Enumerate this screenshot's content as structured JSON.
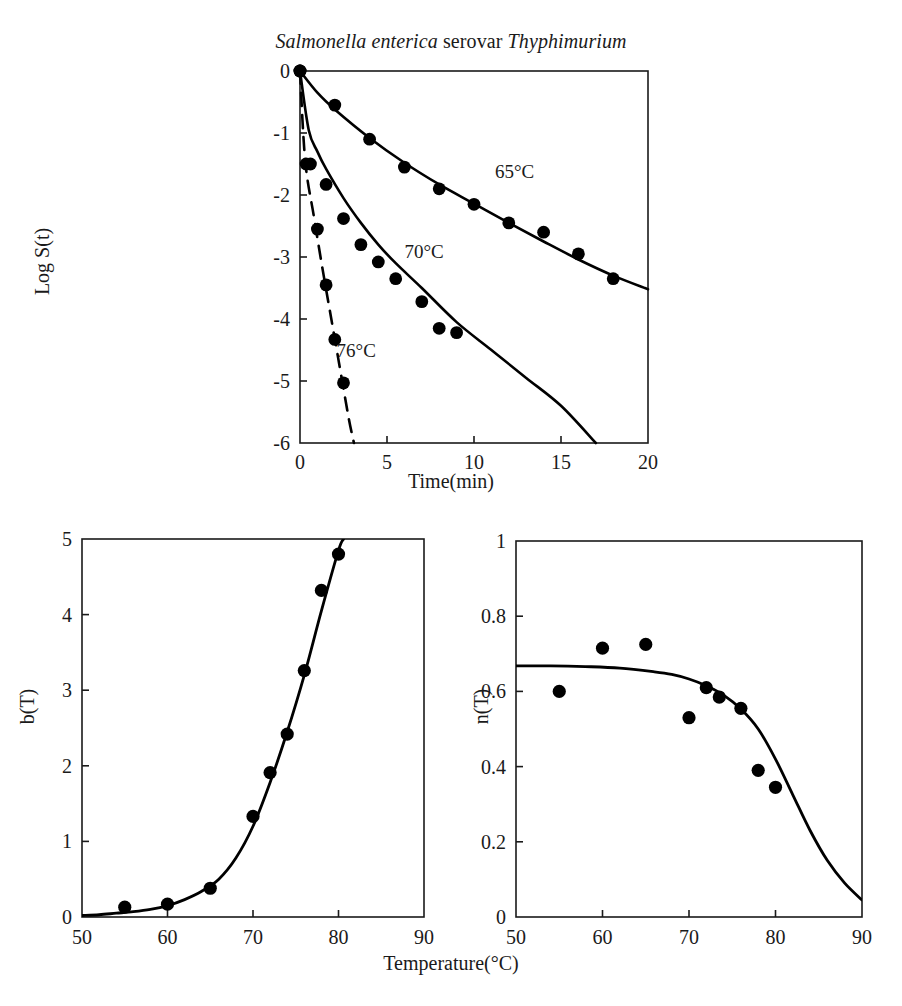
{
  "figure": {
    "title_parts": {
      "genus_species": "Salmonella enterica",
      "connector": " serovar ",
      "serovar": "Thyphimurium"
    },
    "title_full": "Salmonella enterica serovar Thyphimurium",
    "shared_xlabel": "Temperature(°C)",
    "marker_color": "#000000",
    "line_color": "#000000",
    "axis_color": "#1a1a1a",
    "background": "#ffffff"
  },
  "chart_data": [
    {
      "id": "survival-curves",
      "type": "scatter",
      "title": "Salmonella enterica serovar Thyphimurium",
      "xlabel": "Time(min)",
      "ylabel": "Log S(t)",
      "xlim": [
        0,
        20
      ],
      "ylim": [
        -6,
        0
      ],
      "xticks": [
        0,
        5,
        10,
        15,
        20
      ],
      "xtick_labels": [
        "0",
        "5",
        "10",
        "15",
        "20"
      ],
      "yticks": [
        0,
        -1,
        -2,
        -3,
        -4,
        -5,
        -6
      ],
      "ytick_labels": [
        "0",
        "-1",
        "-2",
        "-3",
        "-4",
        "-5",
        "-6"
      ],
      "grid": false,
      "legend": "inline-annotations",
      "series": [
        {
          "name": "65°C",
          "label": "65°C",
          "linestyle": "solid",
          "x": [
            0,
            2,
            4,
            6,
            8,
            10,
            12,
            14,
            16,
            18
          ],
          "y": [
            0,
            -0.55,
            -1.1,
            -1.55,
            -1.9,
            -2.15,
            -2.45,
            -2.6,
            -2.95,
            -3.35
          ],
          "fit_x": [
            0,
            1,
            2,
            4,
            6,
            8,
            10,
            12,
            14,
            16,
            18,
            20
          ],
          "fit_y": [
            0,
            -0.35,
            -0.62,
            -1.08,
            -1.48,
            -1.83,
            -2.14,
            -2.45,
            -2.75,
            -3.04,
            -3.3,
            -3.52
          ]
        },
        {
          "name": "70°C",
          "label": "70°C",
          "linestyle": "solid",
          "x": [
            0,
            0.6,
            1.5,
            2.5,
            3.5,
            4.5,
            5.5,
            7,
            8,
            9
          ],
          "y": [
            0,
            -1.5,
            -1.83,
            -2.38,
            -2.8,
            -3.08,
            -3.35,
            -3.72,
            -4.15,
            -4.22
          ],
          "fit_x": [
            0,
            0.5,
            1,
            1.5,
            2.5,
            3.5,
            4.5,
            5.5,
            7,
            9,
            11,
            13,
            15,
            17
          ],
          "fit_y": [
            0,
            -0.95,
            -1.3,
            -1.58,
            -2.05,
            -2.45,
            -2.8,
            -3.1,
            -3.5,
            -4.05,
            -4.5,
            -4.95,
            -5.4,
            -6.0
          ]
        },
        {
          "name": "76°C",
          "label": "76°C",
          "linestyle": "dashed",
          "x": [
            0,
            0.35,
            1,
            1.5,
            2,
            2.5
          ],
          "y": [
            0,
            -1.5,
            -2.55,
            -3.45,
            -4.33,
            -5.03
          ],
          "fit_x": [
            0,
            0.3,
            0.8,
            1.3,
            1.8,
            2.3,
            2.8,
            3.1
          ],
          "fit_y": [
            0,
            -1.45,
            -2.35,
            -3.2,
            -4.0,
            -4.8,
            -5.6,
            -6.0
          ]
        }
      ]
    },
    {
      "id": "b-parameter",
      "type": "scatter",
      "xlabel": "Temperature(°C)",
      "ylabel": "b(T)",
      "xlim": [
        50,
        90
      ],
      "ylim": [
        0,
        5
      ],
      "xticks": [
        50,
        60,
        70,
        80,
        90
      ],
      "xtick_labels": [
        "50",
        "60",
        "70",
        "80",
        "90"
      ],
      "yticks": [
        0,
        1,
        2,
        3,
        4,
        5
      ],
      "ytick_labels": [
        "0",
        "1",
        "2",
        "3",
        "4",
        "5"
      ],
      "grid": false,
      "points": {
        "x": [
          55,
          60,
          65,
          70,
          72,
          74,
          76,
          78,
          80
        ],
        "y": [
          0.13,
          0.17,
          0.38,
          1.33,
          1.91,
          2.42,
          3.26,
          4.32,
          4.8
        ]
      },
      "fit": {
        "x": [
          50,
          52,
          54,
          56,
          58,
          60,
          62,
          64,
          66,
          68,
          70,
          72,
          74,
          76,
          78,
          80,
          80.6
        ],
        "y": [
          0.02,
          0.03,
          0.05,
          0.07,
          0.1,
          0.15,
          0.23,
          0.34,
          0.5,
          0.78,
          1.2,
          1.78,
          2.45,
          3.2,
          4.05,
          4.85,
          5.0
        ]
      }
    },
    {
      "id": "n-parameter",
      "type": "scatter",
      "xlabel": "Temperature(°C)",
      "ylabel": "n(T)",
      "xlim": [
        50,
        90
      ],
      "ylim": [
        0,
        1
      ],
      "xticks": [
        50,
        60,
        70,
        80,
        90
      ],
      "xtick_labels": [
        "50",
        "60",
        "70",
        "80",
        "90"
      ],
      "yticks": [
        0,
        0.2,
        0.4,
        0.6,
        0.8,
        1
      ],
      "ytick_labels": [
        "0",
        "0.2",
        "0.4",
        "0.6",
        "0.8",
        "1"
      ],
      "grid": false,
      "points": {
        "x": [
          55,
          60,
          65,
          70,
          72,
          73.5,
          76,
          78,
          80
        ],
        "y": [
          0.6,
          0.715,
          0.725,
          0.53,
          0.61,
          0.585,
          0.555,
          0.39,
          0.345
        ]
      },
      "fit": {
        "x": [
          50,
          54,
          58,
          62,
          66,
          68,
          70,
          72,
          74,
          76,
          78,
          80,
          82,
          84,
          86,
          88,
          90
        ],
        "y": [
          0.668,
          0.668,
          0.666,
          0.662,
          0.652,
          0.645,
          0.633,
          0.615,
          0.59,
          0.553,
          0.5,
          0.42,
          0.325,
          0.23,
          0.15,
          0.09,
          0.045
        ]
      }
    }
  ]
}
